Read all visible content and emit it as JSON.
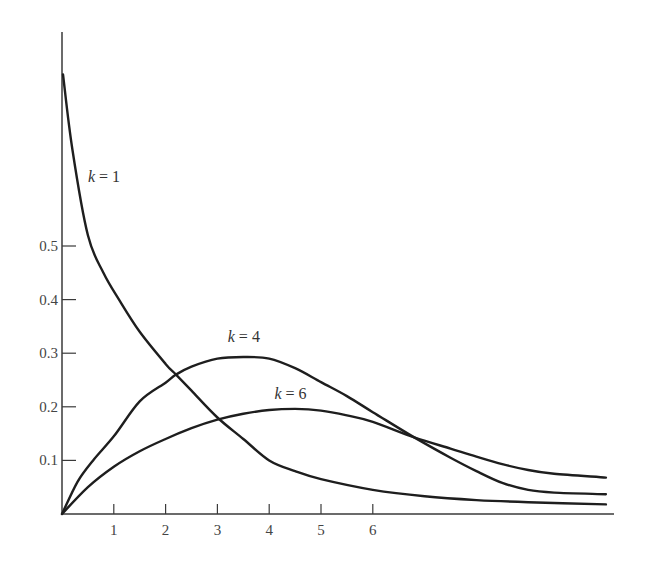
{
  "chart_data": {
    "type": "line",
    "title": "",
    "xlabel": "",
    "ylabel": "",
    "xlim": [
      0,
      10.6
    ],
    "ylim": [
      0,
      0.83
    ],
    "grid": false,
    "legend": "inline labels",
    "x_ticks": [
      "1",
      "2",
      "3",
      "4",
      "5",
      "6"
    ],
    "y_ticks": [
      "0.1",
      "0.2",
      "0.3",
      "0.4",
      "0.5"
    ],
    "series": [
      {
        "name": "k = 1",
        "label_var": "k",
        "label_val": "= 1",
        "x": [
          0.02,
          0.2,
          0.5,
          0.8,
          1.1,
          1.5,
          2.0,
          2.2,
          2.5,
          3.0,
          3.5,
          4.0,
          4.5,
          5.0,
          6.0,
          7.0,
          8.0,
          9.0,
          10.5
        ],
        "values": [
          0.82,
          0.68,
          0.52,
          0.45,
          0.4,
          0.34,
          0.28,
          0.26,
          0.23,
          0.18,
          0.14,
          0.1,
          0.08,
          0.065,
          0.045,
          0.033,
          0.026,
          0.022,
          0.018
        ]
      },
      {
        "name": "k = 4",
        "label_var": "k",
        "label_val": "= 4",
        "x": [
          0,
          0.3,
          0.6,
          1.0,
          1.5,
          2.0,
          2.2,
          2.5,
          3.0,
          3.5,
          4.0,
          4.5,
          5.0,
          5.5,
          6.0,
          6.8,
          7.5,
          8.0,
          8.5,
          9.0,
          9.5,
          10.5
        ],
        "values": [
          0,
          0.06,
          0.1,
          0.145,
          0.21,
          0.245,
          0.26,
          0.275,
          0.29,
          0.293,
          0.29,
          0.272,
          0.246,
          0.22,
          0.19,
          0.143,
          0.105,
          0.08,
          0.058,
          0.045,
          0.04,
          0.037
        ]
      },
      {
        "name": "k = 6",
        "label_var": "k",
        "label_val": "= 6",
        "x": [
          0,
          0.5,
          1.0,
          1.5,
          2.0,
          2.5,
          3.0,
          3.5,
          4.0,
          4.5,
          5.0,
          5.5,
          6.0,
          6.8,
          7.5,
          8.0,
          8.5,
          9.0,
          9.5,
          10.5
        ],
        "values": [
          0,
          0.05,
          0.088,
          0.117,
          0.14,
          0.16,
          0.176,
          0.187,
          0.194,
          0.196,
          0.193,
          0.184,
          0.172,
          0.143,
          0.122,
          0.107,
          0.093,
          0.082,
          0.075,
          0.068
        ]
      }
    ],
    "annotations": [
      {
        "text": "k = 1",
        "x": 0.5,
        "y": 0.62
      },
      {
        "text": "k = 4",
        "x": 3.2,
        "y": 0.32
      },
      {
        "text": "k = 6",
        "x": 4.1,
        "y": 0.215
      }
    ]
  }
}
